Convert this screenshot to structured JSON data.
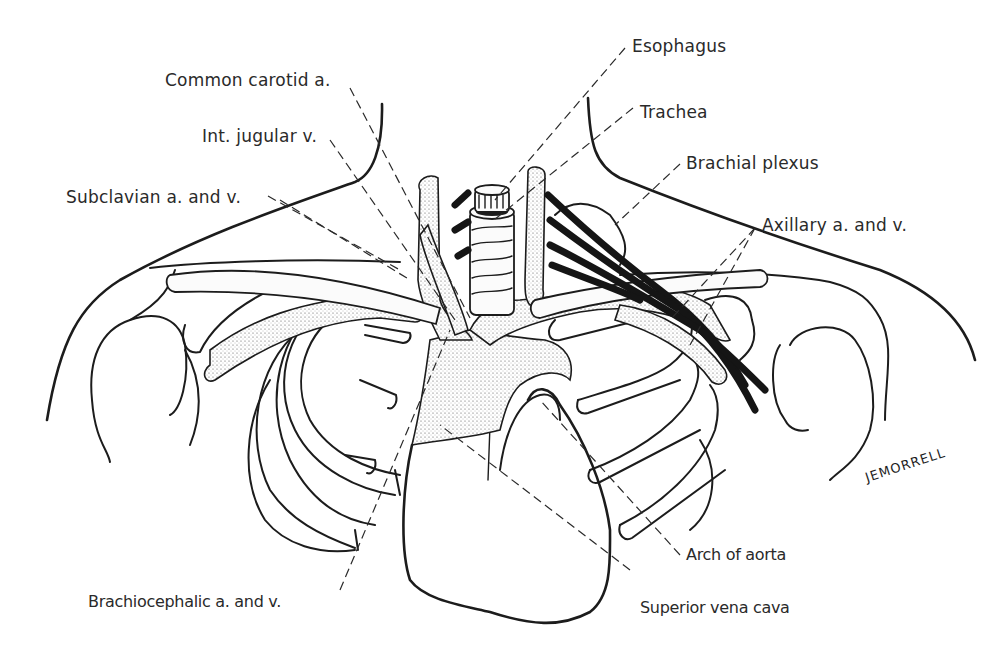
{
  "figure": {
    "colors": {
      "ink": "#1c1c1c",
      "label": "#2a2a2a",
      "background": "#ffffff"
    }
  },
  "labels": {
    "esophagus": "Esophagus",
    "common_carotid": "Common carotid a.",
    "trachea": "Trachea",
    "int_jugular": "Int. jugular v.",
    "brachial_plexus": "Brachial plexus",
    "subclavian": "Subclavian a. and v.",
    "axillary": "Axillary a. and v.",
    "arch_of_aorta": "Arch of aorta",
    "brachiocephalic": "Brachiocephalic a. and v.",
    "superior_vena_cava": "Superior vena cava"
  },
  "signature": "JEMORRELL"
}
